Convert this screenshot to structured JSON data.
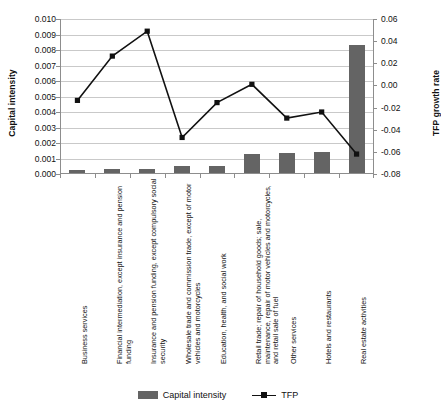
{
  "chart_data": {
    "type": "bar",
    "title": "",
    "subtitle": "",
    "categories": [
      "Business services",
      "Financial intermediation, except insurance and pension funding",
      "Insurance and pension funding, except compulsory social security",
      "Wholesale trade and commission trade, except of motor vehicles and motorcycles",
      "Education, health, and social work",
      "Retail trade; repair of household goods; sale, maintenance, repair of motor vehicles and motorcycles, and retail sale of fuel",
      "Other services",
      "Hotels and restaurants",
      "Real estate activities"
    ],
    "series": [
      {
        "name": "Capital intensity",
        "type": "bar",
        "axis": "left",
        "color": "#646464",
        "values": [
          0.00026,
          0.00033,
          0.00031,
          0.00053,
          0.0005,
          0.00128,
          0.00135,
          0.00143,
          0.00835
        ]
      },
      {
        "name": "TFP",
        "type": "line",
        "axis": "right",
        "color": "#111111",
        "marker": "square",
        "values": [
          -0.0135,
          0.0265,
          0.049,
          -0.047,
          -0.0155,
          0.001,
          -0.0295,
          -0.024,
          -0.062
        ]
      }
    ],
    "xlabel": "",
    "ylabel": "Capital intensity",
    "y2label": "TFP growth rate",
    "ylim": [
      0.0,
      0.01
    ],
    "ytick_step": 0.001,
    "yticks": [
      "0.000",
      "0.001",
      "0.002",
      "0.003",
      "0.004",
      "0.005",
      "0.006",
      "0.007",
      "0.008",
      "0.009",
      "0.010"
    ],
    "y2lim": [
      -0.08,
      0.06
    ],
    "y2tick_step": 0.02,
    "y2ticks": [
      "-0.08",
      "-0.06",
      "-0.04",
      "-0.02",
      "0.00",
      "0.02",
      "0.04",
      "0.06"
    ],
    "grid": true,
    "legend_position": "bottom",
    "legend": [
      "Capital intensity",
      "TFP"
    ]
  },
  "legend": {
    "capital_intensity": "Capital intensity",
    "tfp": "TFP"
  },
  "axes": {
    "left_title": "Capital intensity",
    "right_title": "TFP growth rate"
  }
}
